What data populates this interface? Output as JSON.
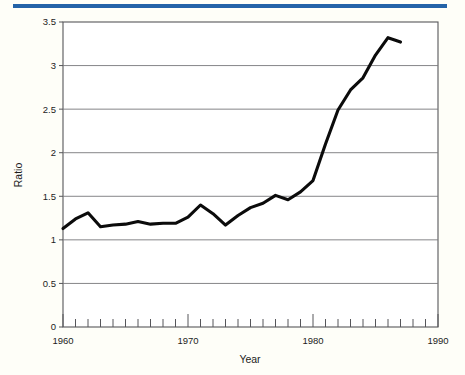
{
  "accent": {
    "color": "#2463a8",
    "name": "top-accent-bar"
  },
  "chart_data": {
    "type": "line",
    "title": "",
    "xlabel": "Year",
    "ylabel": "Ratio",
    "xlim": [
      1960,
      1990
    ],
    "ylim": [
      0,
      3.5
    ],
    "grid": true,
    "legend": "none",
    "x_tick_labels": [
      "1960",
      "1970",
      "1980",
      "1990"
    ],
    "x_major_ticks": [
      1960,
      1970,
      1980,
      1990
    ],
    "x_minor_tick_interval": 1,
    "y_tick_labels": [
      "0",
      "0.5",
      "1",
      "1.5",
      "2",
      "2.5",
      "3",
      "3.5"
    ],
    "y_ticks": [
      0,
      0.5,
      1,
      1.5,
      2,
      2.5,
      3,
      3.5
    ],
    "series": [
      {
        "name": "Ratio",
        "color": "#0b0b0b",
        "x": [
          1960,
          1961,
          1962,
          1963,
          1964,
          1965,
          1966,
          1967,
          1968,
          1969,
          1970,
          1971,
          1972,
          1973,
          1974,
          1975,
          1976,
          1977,
          1978,
          1979,
          1980,
          1981,
          1982,
          1983,
          1984,
          1985,
          1986,
          1987
        ],
        "values": [
          1.13,
          1.24,
          1.31,
          1.15,
          1.17,
          1.18,
          1.21,
          1.18,
          1.19,
          1.19,
          1.26,
          1.4,
          1.3,
          1.17,
          1.28,
          1.37,
          1.42,
          1.51,
          1.46,
          1.55,
          1.68,
          2.1,
          2.49,
          2.72,
          2.86,
          3.12,
          3.32,
          3.27
        ]
      }
    ]
  }
}
